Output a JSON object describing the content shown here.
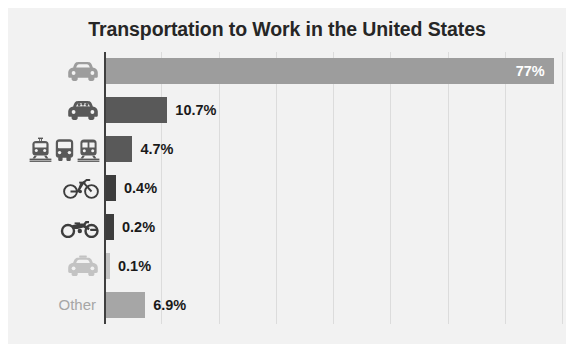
{
  "chart_data": {
    "type": "bar",
    "orientation": "horizontal",
    "title": "Transportation to Work in the United States",
    "xlabel": "",
    "ylabel": "",
    "xlim": [
      0,
      78.6
    ],
    "grid": true,
    "gridlines_count": 8,
    "legend": "none",
    "categories": [
      "Car, truck or van - drove alone",
      "Car, truck or van - carpooled",
      "Public transportation",
      "Bicycle",
      "Motorcycle",
      "Taxicab",
      "Other"
    ],
    "category_icons": [
      [
        "car-icon"
      ],
      [
        "carpool-car-icon"
      ],
      [
        "tram-icon",
        "bus-icon",
        "train-icon"
      ],
      [
        "bicycle-icon"
      ],
      [
        "motorcycle-icon"
      ],
      [
        "taxi-icon"
      ],
      []
    ],
    "category_text_labels": [
      "",
      "",
      "",
      "",
      "",
      "",
      "Other"
    ],
    "values": [
      77,
      10.7,
      4.7,
      0.4,
      0.2,
      0.1,
      6.9
    ],
    "value_labels": [
      "77%",
      "10.7%",
      "4.7%",
      "0.4%",
      "0.2%",
      "0.1%",
      "6.9%"
    ],
    "label_placement": [
      "inside",
      "outside",
      "outside",
      "outside",
      "outside",
      "outside",
      "outside"
    ],
    "bar_colors": [
      "#9d9d9d",
      "#595959",
      "#595959",
      "#3d3d3d",
      "#3d3d3d",
      "#c3c3c3",
      "#a6a6a6"
    ],
    "min_visual_widths_px": [
      0,
      0,
      0,
      11,
      9,
      5,
      0
    ]
  },
  "colors": {
    "panel_background": "#f2f2f2",
    "page_background": "#ffffff",
    "title_text": "#262626",
    "axis_line": "#3f3f3f",
    "gridline": "#dcdcdc",
    "label_text": "#1a1a1a",
    "inside_label_text": "#ffffff",
    "other_category_text": "#a6a6a6"
  }
}
